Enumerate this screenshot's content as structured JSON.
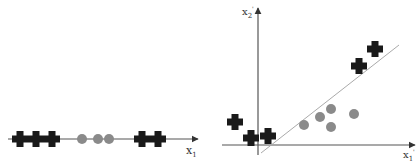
{
  "colors": {
    "axis": "#555555",
    "cross": "#1a1a1a",
    "circle": "#8a8a8a",
    "separator": "#aaaaaa"
  },
  "left_plot": {
    "axis_label": "x",
    "axis_label_sub": "1",
    "crosses_x": [
      20,
      36,
      52,
      142,
      158
    ],
    "circles_x": [
      82,
      98,
      109
    ],
    "axis_y": 139
  },
  "right_plot": {
    "x_axis_label": "x",
    "x_axis_label_sub": "1",
    "x_axis_label_prime": "'",
    "y_axis_label": "x",
    "y_axis_label_sub": "2",
    "y_axis_label_prime": "'",
    "crosses": [
      [
        235,
        122
      ],
      [
        251,
        138
      ],
      [
        268,
        136
      ],
      [
        359,
        66
      ],
      [
        375,
        49
      ]
    ],
    "circles": [
      [
        304,
        125
      ],
      [
        320,
        117
      ],
      [
        331,
        109
      ],
      [
        331,
        127
      ],
      [
        354,
        114
      ]
    ],
    "separator_line": [
      [
        261,
        153
      ],
      [
        399,
        45
      ]
    ]
  }
}
